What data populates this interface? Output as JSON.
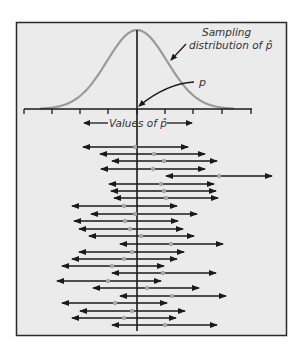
{
  "figure": {
    "background": "#ebebeb",
    "frame_color": "#2a2a2a",
    "curve_color": "#9a9a9a",
    "line_color": "#1a1a1a",
    "dot_color": "#a8a8a8"
  },
  "labels": {
    "sampling_line1": "Sampling",
    "sampling_line2": "distribution of p̂",
    "p_label": "p",
    "axis_label": "Values of p̂"
  },
  "chart_data": {
    "type": "diagram",
    "title": "",
    "xlabel": "Values of p̂",
    "curve": {
      "kind": "normal",
      "center_px": 137,
      "peak_y_px": 30,
      "baseline_y_px": 109
    },
    "axis": {
      "y_px": 109,
      "x_start_px": 24,
      "x_end_px": 252,
      "ticks_px": [
        24,
        52,
        80,
        108,
        137,
        165,
        193,
        222,
        251
      ]
    },
    "true_p_x_px": 137,
    "intervals": [
      {
        "y": 147,
        "left": 80,
        "center": 135,
        "right": 191
      },
      {
        "y": 154,
        "left": 97,
        "center": 154,
        "right": 208
      },
      {
        "y": 161,
        "left": 109,
        "center": 164,
        "right": 220
      },
      {
        "y": 169,
        "left": 98,
        "center": 153,
        "right": 208
      },
      {
        "y": 176,
        "left": 163,
        "center": 219,
        "right": 275
      },
      {
        "y": 184,
        "left": 106,
        "center": 161,
        "right": 217
      },
      {
        "y": 191,
        "left": 108,
        "center": 164,
        "right": 219
      },
      {
        "y": 198,
        "left": 111,
        "center": 166,
        "right": 221
      },
      {
        "y": 206,
        "left": 69,
        "center": 124,
        "right": 180
      },
      {
        "y": 214,
        "left": 88,
        "center": 135,
        "right": 200
      },
      {
        "y": 221,
        "left": 71,
        "center": 125,
        "right": 181
      },
      {
        "y": 229,
        "left": 76,
        "center": 130,
        "right": 186
      },
      {
        "y": 236,
        "left": 86,
        "center": 141,
        "right": 197
      },
      {
        "y": 244,
        "left": 117,
        "center": 171,
        "right": 226
      },
      {
        "y": 252,
        "left": 76,
        "center": 132,
        "right": 187
      },
      {
        "y": 259,
        "left": 69,
        "center": 124,
        "right": 180
      },
      {
        "y": 266,
        "left": 59,
        "center": 112,
        "right": 167
      },
      {
        "y": 273,
        "left": 109,
        "center": 163,
        "right": 219
      },
      {
        "y": 281,
        "left": 54,
        "center": 108,
        "right": 164
      },
      {
        "y": 288,
        "left": 90,
        "center": 147,
        "right": 202
      },
      {
        "y": 296,
        "left": 117,
        "center": 172,
        "right": 229
      },
      {
        "y": 303,
        "left": 59,
        "center": 115,
        "right": 170
      },
      {
        "y": 311,
        "left": 77,
        "center": 132,
        "right": 188
      },
      {
        "y": 318,
        "left": 69,
        "center": 124,
        "right": 179
      },
      {
        "y": 325,
        "left": 109,
        "center": 165,
        "right": 220
      }
    ]
  }
}
